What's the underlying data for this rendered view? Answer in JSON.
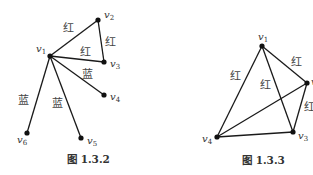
{
  "figures": [
    {
      "id": "fig-1-3-2",
      "caption": "图 1.3.2",
      "caption_pos": [
        67,
        163
      ],
      "vertices": [
        {
          "name": "v",
          "sub": "1",
          "x": 50,
          "y": 56,
          "lx": 36,
          "ly": 52
        },
        {
          "name": "v",
          "sub": "2",
          "x": 98,
          "y": 20,
          "lx": 104,
          "ly": 18
        },
        {
          "name": "v",
          "sub": "3",
          "x": 104,
          "y": 62,
          "lx": 110,
          "ly": 67
        },
        {
          "name": "v",
          "sub": "4",
          "x": 104,
          "y": 95,
          "lx": 110,
          "ly": 100
        },
        {
          "name": "v",
          "sub": "5",
          "x": 81,
          "y": 138,
          "lx": 87,
          "ly": 144
        },
        {
          "name": "v",
          "sub": "6",
          "x": 27,
          "y": 133,
          "lx": 17,
          "ly": 143
        }
      ],
      "edges": [
        {
          "from": 0,
          "to": 1,
          "color": "红",
          "lx": 63,
          "ly": 32
        },
        {
          "from": 1,
          "to": 2,
          "color": "红",
          "lx": 105,
          "ly": 46
        },
        {
          "from": 0,
          "to": 2,
          "color": "红",
          "lx": 80,
          "ly": 56
        },
        {
          "from": 0,
          "to": 3,
          "color": "蓝",
          "lx": 82,
          "ly": 78
        },
        {
          "from": 0,
          "to": 5,
          "color": "蓝",
          "lx": 18,
          "ly": 104
        },
        {
          "from": 0,
          "to": 4,
          "color": "蓝",
          "lx": 52,
          "ly": 107
        }
      ]
    },
    {
      "id": "fig-1-3-3",
      "caption": "图 1.3.3",
      "caption_pos": [
        242,
        164
      ],
      "vertices": [
        {
          "name": "v",
          "sub": "1",
          "x": 262,
          "y": 46,
          "lx": 258,
          "ly": 40
        },
        {
          "name": "v",
          "sub": "2",
          "x": 307,
          "y": 83,
          "lx": 311,
          "ly": 85
        },
        {
          "name": "v",
          "sub": "3",
          "x": 293,
          "y": 132,
          "lx": 298,
          "ly": 139
        },
        {
          "name": "v",
          "sub": "4",
          "x": 217,
          "y": 137,
          "lx": 202,
          "ly": 142
        }
      ],
      "edges": [
        {
          "from": 0,
          "to": 1,
          "color": "红",
          "lx": 291,
          "ly": 66
        },
        {
          "from": 0,
          "to": 3,
          "color": "红",
          "lx": 230,
          "ly": 80
        },
        {
          "from": 0,
          "to": 2,
          "color": "红",
          "lx": 260,
          "ly": 89
        },
        {
          "from": 1,
          "to": 2,
          "color": "红",
          "lx": 304,
          "ly": 111
        },
        {
          "from": 1,
          "to": 3,
          "color": "",
          "lx": 0,
          "ly": 0
        },
        {
          "from": 2,
          "to": 3,
          "color": "",
          "lx": 0,
          "ly": 0
        }
      ]
    }
  ]
}
